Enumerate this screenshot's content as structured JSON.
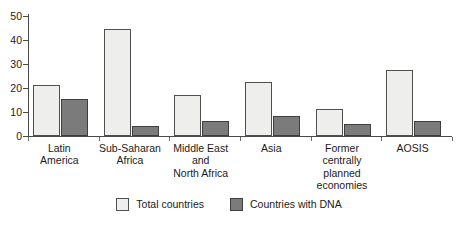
{
  "chart_data": {
    "type": "bar",
    "title": "",
    "subtitle": "",
    "xlabel": "",
    "ylabel": "",
    "ylim": [
      0,
      50
    ],
    "yticks": [
      0,
      10,
      20,
      30,
      40,
      50
    ],
    "grid": false,
    "legend_position": "bottom-center",
    "categories": [
      "Latin\nAmerica",
      "Sub-Saharan\nAfrica",
      "Middle East\nand\nNorth Africa",
      "Asia",
      "Former\ncentrally\nplanned\neconomies",
      "AOSIS"
    ],
    "series": [
      {
        "name": "Total countries",
        "color": "#eeeeec",
        "values": [
          21,
          44,
          17,
          22,
          11,
          27
        ]
      },
      {
        "name": "Countries with DNA",
        "color": "#7b7b7b",
        "values": [
          15,
          4,
          6,
          8,
          5,
          6
        ]
      }
    ]
  },
  "legend": {
    "items": [
      {
        "label": "Total countries",
        "swatch": "light-swatch-icon"
      },
      {
        "label": "Countries with DNA",
        "swatch": "dark-swatch-icon"
      }
    ]
  },
  "axis": {
    "y_tick_labels": [
      "50",
      "40",
      "30",
      "20",
      "10",
      "0"
    ]
  },
  "colors": {
    "series_total": "#eeeeec",
    "series_dna": "#7b7b7b",
    "axis": "#4a4a4a",
    "text": "#1a1a1a",
    "background": "#ffffff"
  }
}
